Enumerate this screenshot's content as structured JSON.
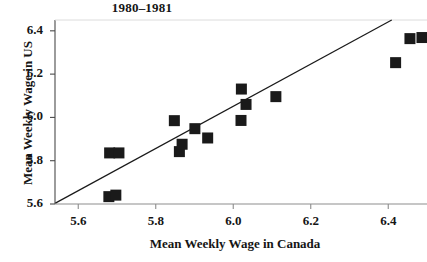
{
  "chart_data": {
    "type": "scatter",
    "title": "1980–1981",
    "xlabel": "Mean Weekly Wage in Canada",
    "ylabel": "Mean Weekly Wage in US",
    "xlim": [
      5.54,
      6.5
    ],
    "ylim": [
      5.6,
      6.45
    ],
    "xticks": [
      "5.6",
      "5.8",
      "6.0",
      "6.2",
      "6.4"
    ],
    "xtick_values": [
      5.6,
      5.8,
      6.0,
      6.2,
      6.4
    ],
    "yticks": [
      "5.6",
      "5.8",
      "6.0",
      "6.2",
      "6.4"
    ],
    "ytick_values": [
      5.6,
      5.8,
      6.0,
      6.2,
      6.4
    ],
    "grid": false,
    "legend": "none",
    "marker": "filled-square",
    "marker_color": "#1a1a1a",
    "points": [
      {
        "x": 5.681,
        "y": 5.836
      },
      {
        "x": 5.705,
        "y": 5.836
      },
      {
        "x": 5.679,
        "y": 5.634
      },
      {
        "x": 5.697,
        "y": 5.641
      },
      {
        "x": 5.848,
        "y": 5.985
      },
      {
        "x": 5.861,
        "y": 5.842
      },
      {
        "x": 5.868,
        "y": 5.876
      },
      {
        "x": 5.901,
        "y": 5.948
      },
      {
        "x": 5.934,
        "y": 5.905
      },
      {
        "x": 6.021,
        "y": 6.131
      },
      {
        "x": 6.033,
        "y": 6.06
      },
      {
        "x": 6.02,
        "y": 5.986
      },
      {
        "x": 6.11,
        "y": 6.096
      },
      {
        "x": 6.419,
        "y": 6.253
      },
      {
        "x": 6.456,
        "y": 6.364
      },
      {
        "x": 6.487,
        "y": 6.369
      }
    ],
    "reference_line": {
      "label": "45-degree reference line",
      "x1": 5.541,
      "y1": 5.604,
      "x2": 6.409,
      "y2": 6.45
    }
  }
}
